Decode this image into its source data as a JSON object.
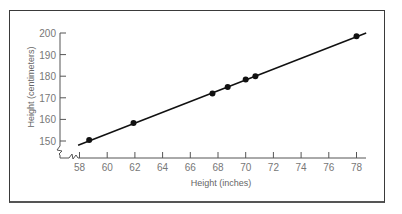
{
  "chart_data": {
    "type": "scatter",
    "title": "",
    "xlabel": "Height (inches)",
    "ylabel": "Height (centimeters)",
    "x_ticks": [
      "58",
      "60",
      "62",
      "64",
      "66",
      "68",
      "70",
      "72",
      "74",
      "76",
      "78"
    ],
    "y_ticks": [
      "150",
      "160",
      "170",
      "180",
      "190",
      "200"
    ],
    "xlim": [
      58,
      78.7
    ],
    "ylim": [
      150,
      200
    ],
    "axis_breaks": [
      "x",
      "y"
    ],
    "grid": false,
    "legend": null,
    "fit_line": {
      "from": [
        57.9,
        148
      ],
      "to": [
        78.7,
        200
      ]
    },
    "series": [
      {
        "name": "Height",
        "points": [
          {
            "x": 58.7,
            "y": 150.5
          },
          {
            "x": 61.9,
            "y": 158.3
          },
          {
            "x": 67.6,
            "y": 172
          },
          {
            "x": 68.7,
            "y": 175
          },
          {
            "x": 70.0,
            "y": 178.5
          },
          {
            "x": 70.7,
            "y": 180
          },
          {
            "x": 78.0,
            "y": 198.5
          }
        ]
      }
    ]
  }
}
